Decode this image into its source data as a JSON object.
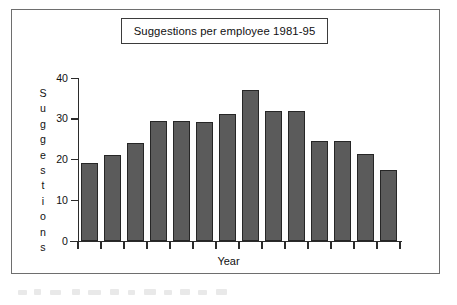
{
  "figure": {
    "title": "Suggestions per employee 1981-95",
    "border_color": "#6e6e6e",
    "bar_color": "#5b5b5b",
    "bar_edge_color": "#262626",
    "axis_color": "#2b2b2b"
  },
  "chart_data": {
    "type": "bar",
    "title": "Suggestions per employee 1981-95",
    "xlabel": "Year",
    "ylabel": "Suggestions",
    "ylim": [
      0,
      40
    ],
    "yticks": [
      0,
      10,
      20,
      30,
      40
    ],
    "ytick_labels": [
      "0",
      "10",
      "20",
      "30",
      "40"
    ],
    "grid": false,
    "legend": false,
    "xtick_labels": [
      "",
      "",
      "",
      "",
      "",
      "",
      "",
      "",
      "",
      "",
      "",
      "",
      "",
      ""
    ],
    "categories": [
      "1981",
      "1982",
      "1983",
      "1984",
      "1985",
      "1986",
      "1987",
      "1988",
      "1989",
      "1990",
      "1991",
      "1992",
      "1993",
      "1994"
    ],
    "values": [
      19.2,
      21.1,
      24.1,
      29.4,
      29.5,
      29.3,
      31.1,
      37.0,
      31.9,
      32.0,
      24.6,
      24.6,
      21.3,
      17.5
    ],
    "bar_count": 14
  },
  "y_axis": {
    "label_letters": [
      "S",
      "u",
      "g",
      "g",
      "e",
      "s",
      "t",
      "i",
      "o",
      "n",
      "s"
    ]
  },
  "x_axis": {
    "label": "Year"
  }
}
